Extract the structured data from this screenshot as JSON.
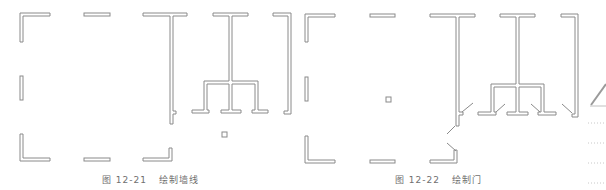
{
  "figures": [
    {
      "id_label": "图 12-21",
      "title": "绘制墙线"
    },
    {
      "id_label": "图 12-22",
      "title": "绘制门"
    }
  ],
  "icons": {
    "margin_icon": "pencil-icon"
  },
  "colors": {
    "line": "#8a8a8a",
    "caption": "#6f6f6f",
    "background": "#ffffff"
  }
}
